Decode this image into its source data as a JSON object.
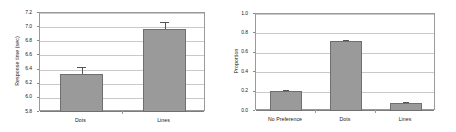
{
  "figure": {
    "panel_count": 2
  },
  "chart_data": [
    {
      "type": "bar",
      "panel": "left",
      "title": "",
      "xlabel": "",
      "ylabel": "Response time (sec)",
      "categories": [
        "Dots",
        "Lines"
      ],
      "values": [
        6.34,
        6.97
      ],
      "errors": [
        0.09,
        0.1
      ],
      "ylim": [
        5.8,
        7.2
      ],
      "yticks": [
        "5.8",
        "6.0",
        "6.2",
        "6.4",
        "6.6",
        "6.8",
        "7.0",
        "7.2"
      ],
      "ytick_values": [
        5.8,
        6.0,
        6.2,
        6.4,
        6.6,
        6.8,
        7.0,
        7.2
      ],
      "grid": true,
      "legend": "none",
      "bar_color": "#9a9a9a",
      "bar_edge_color": "#6f6f6f",
      "error_color": "#555555"
    },
    {
      "type": "bar",
      "panel": "right",
      "title": "",
      "xlabel": "",
      "ylabel": "Proportion",
      "categories": [
        "No Preference",
        "Dots",
        "Lines"
      ],
      "values": [
        0.21,
        0.72,
        0.08
      ],
      "errors": [
        0.01,
        0.01,
        0.01
      ],
      "ylim": [
        0.0,
        1.0
      ],
      "yticks": [
        "0.0",
        "0.2",
        "0.4",
        "0.6",
        "0.8",
        "1.0"
      ],
      "ytick_values": [
        0.0,
        0.2,
        0.4,
        0.6,
        0.8,
        1.0
      ],
      "grid": true,
      "legend": "none",
      "bar_color": "#9a9a9a",
      "bar_edge_color": "#6f6f6f",
      "error_color": "#555555"
    }
  ]
}
